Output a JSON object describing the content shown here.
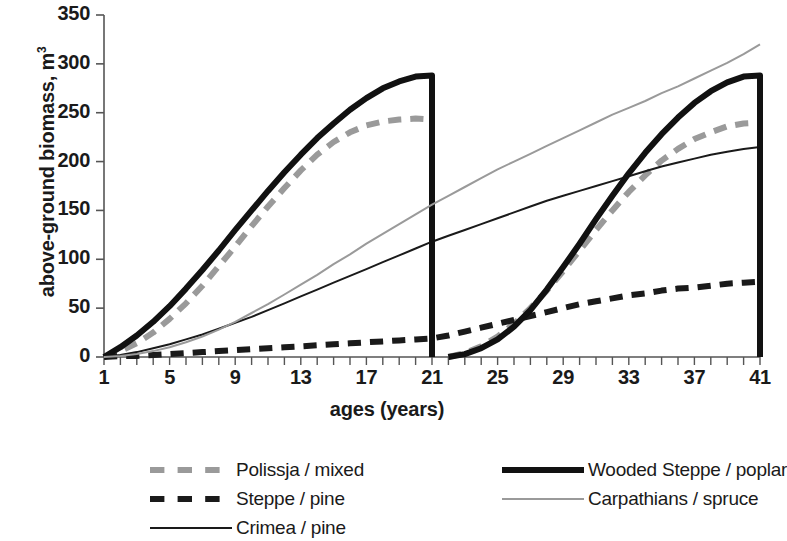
{
  "chart_data": {
    "type": "line",
    "title": "",
    "xlabel": "ages (years)",
    "ylabel": "above-ground biomass, m",
    "ylabel_sup": "3",
    "xlim": [
      1,
      41
    ],
    "ylim": [
      0,
      350
    ],
    "grid": false,
    "legend_position": "bottom",
    "ytick_labels": [
      "350",
      "300",
      "250",
      "200",
      "150",
      "100",
      "50",
      "0"
    ],
    "ytick_values": [
      350,
      300,
      250,
      200,
      150,
      100,
      50,
      0
    ],
    "xtick_labels": [
      "1",
      "5",
      "9",
      "13",
      "17",
      "21",
      "25",
      "29",
      "33",
      "37",
      "41"
    ],
    "xtick_values": [
      1,
      5,
      9,
      13,
      17,
      21,
      25,
      29,
      33,
      37,
      41
    ],
    "x": [
      1,
      2,
      3,
      4,
      5,
      6,
      7,
      8,
      9,
      10,
      11,
      12,
      13,
      14,
      15,
      16,
      17,
      18,
      19,
      20,
      21,
      22,
      23,
      24,
      25,
      26,
      27,
      28,
      29,
      30,
      31,
      32,
      33,
      34,
      35,
      36,
      37,
      38,
      39,
      40,
      41
    ],
    "series": [
      {
        "name": "Polissja / mixed",
        "color": "#9a9a9a",
        "style": "dashed",
        "width": 6,
        "values": [
          0,
          6,
          14,
          25,
          39,
          55,
          73,
          93,
          113,
          134,
          154,
          173,
          191,
          207,
          220,
          230,
          237,
          241,
          243,
          244,
          243,
          0,
          4,
          11,
          21,
          34,
          50,
          68,
          88,
          109,
          130,
          150,
          169,
          186,
          201,
          213,
          223,
          230,
          236,
          239,
          240
        ]
      },
      {
        "name": "Steppe / pine",
        "color": "#1a1a1a",
        "style": "dashed",
        "width": 6,
        "values": [
          0,
          1,
          1,
          2,
          3,
          4,
          5,
          6,
          7,
          8,
          9,
          10,
          11,
          12,
          13,
          14,
          15,
          16,
          17,
          18,
          19,
          22,
          26,
          30,
          34,
          38,
          42,
          46,
          50,
          54,
          57,
          60,
          63,
          65,
          68,
          70,
          71,
          73,
          75,
          76,
          77
        ]
      },
      {
        "name": "Crimea / pine",
        "color": "#1a1a1a",
        "style": "solid",
        "width": 2,
        "values": [
          0,
          2,
          5,
          9,
          13,
          18,
          23,
          29,
          35,
          41,
          48,
          55,
          62,
          69,
          76,
          83,
          90,
          97,
          104,
          111,
          118,
          124,
          130,
          136,
          142,
          148,
          154,
          160,
          165,
          170,
          175,
          180,
          185,
          190,
          195,
          199,
          203,
          207,
          210,
          213,
          215
        ]
      },
      {
        "name": "Wooded Steppe / poplar",
        "color": "#111111",
        "style": "solid",
        "width": 6,
        "values": [
          0,
          10,
          22,
          36,
          52,
          70,
          89,
          109,
          130,
          150,
          170,
          189,
          207,
          224,
          239,
          253,
          265,
          275,
          282,
          287,
          288,
          0,
          3,
          9,
          18,
          31,
          48,
          69,
          92,
          116,
          141,
          165,
          188,
          209,
          228,
          245,
          260,
          272,
          281,
          287,
          288
        ]
      },
      {
        "name": "Carpathians / spruce",
        "color": "#9a9a9a",
        "style": "solid",
        "width": 2,
        "values": [
          0,
          1,
          3,
          6,
          10,
          15,
          21,
          28,
          36,
          45,
          54,
          64,
          74,
          84,
          95,
          105,
          116,
          126,
          136,
          146,
          156,
          165,
          174,
          183,
          192,
          200,
          208,
          216,
          224,
          232,
          240,
          248,
          255,
          262,
          270,
          277,
          285,
          293,
          301,
          310,
          320
        ]
      }
    ]
  },
  "legend": {
    "left_column": [
      {
        "label": "Polissja / mixed",
        "key": "dashed-gray-thick-key"
      },
      {
        "label": "Steppe / pine",
        "key": "dashed-black-thick-key"
      },
      {
        "label": "Crimea / pine",
        "key": "solid-black-thin-key"
      }
    ],
    "right_column": [
      {
        "label": "Wooded Steppe / poplar",
        "key": "solid-black-thick-key"
      },
      {
        "label": "Carpathians / spruce",
        "key": "solid-gray-thin-key"
      }
    ]
  }
}
